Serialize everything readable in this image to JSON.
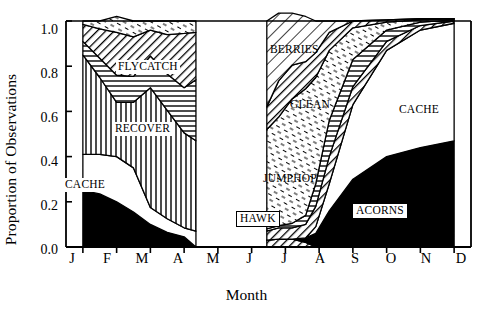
{
  "chart_data": {
    "type": "area",
    "title": "",
    "subtitle": "",
    "xlabel": "Month",
    "ylabel": "Proportion of Observations",
    "xlim": [
      0.5,
      12.5
    ],
    "ylim": [
      0.0,
      1.0
    ],
    "grid": false,
    "legend_position": "inline-annotations",
    "stacked": true,
    "normalized": true,
    "categories": [
      "J",
      "F",
      "M",
      "A",
      "M",
      "J",
      "J",
      "A",
      "S",
      "O",
      "N",
      "D"
    ],
    "xtick_labels": [
      "J",
      "F",
      "M",
      "A",
      "M",
      "J",
      "J",
      "A",
      "S",
      "O",
      "N",
      "D"
    ],
    "ytick_labels": [
      "0.0",
      "0.2",
      "0.4",
      "0.6",
      "0.8",
      "1.0"
    ],
    "ytick_values": [
      0.0,
      0.2,
      0.4,
      0.6,
      0.8,
      1.0
    ],
    "note": "Two disjoint data panels: winter-spring (Jan-late Apr) and summer-winter (mid Jun-Dec); no data plotted for May to mid June.",
    "panels": [
      {
        "name": "winter-spring",
        "x_start": 1.0,
        "x_end": 4.35,
        "series": [
          {
            "name": "ACORNS",
            "fill": "black",
            "x": [
              1.0,
              1.5,
              2.0,
              2.5,
              3.0,
              3.5,
              4.0,
              4.35
            ],
            "values": [
              0.25,
              0.235,
              0.2,
              0.155,
              0.1,
              0.065,
              0.045,
              0.0
            ]
          },
          {
            "name": "CACHE",
            "fill": "white",
            "x": [
              1.0,
              1.5,
              2.0,
              2.5,
              3.0,
              3.5,
              4.0,
              4.35
            ],
            "values": [
              0.16,
              0.175,
              0.2,
              0.195,
              0.075,
              0.06,
              0.04,
              0.07
            ]
          },
          {
            "name": "RECOVER",
            "fill": "vertical-lines",
            "x": [
              1.0,
              1.5,
              2.0,
              2.5,
              3.0,
              3.5,
              4.0,
              4.35
            ],
            "values": [
              0.44,
              0.34,
              0.24,
              0.29,
              0.53,
              0.48,
              0.42,
              0.4
            ]
          },
          {
            "name": "HORIZ-BAND",
            "fill": "horizontal-lines",
            "x": [
              1.0,
              1.5,
              2.0,
              2.5,
              3.0,
              3.5,
              4.0,
              4.35
            ],
            "values": [
              0.06,
              0.085,
              0.12,
              0.115,
              0.14,
              0.16,
              0.2,
              0.27
            ]
          },
          {
            "name": "FLYCATCH",
            "fill": "diagonal-hatch",
            "x": [
              1.0,
              1.5,
              2.0,
              2.5,
              3.0,
              3.5,
              4.0,
              4.35
            ],
            "values": [
              0.075,
              0.13,
              0.19,
              0.175,
              0.115,
              0.175,
              0.24,
              0.21
            ]
          },
          {
            "name": "DASH-TOP",
            "fill": "dash-texture",
            "x": [
              1.0,
              1.5,
              2.0,
              2.5,
              3.0,
              3.5,
              4.0,
              4.35
            ],
            "values": [
              0.015,
              0.035,
              0.07,
              0.07,
              0.04,
              0.06,
              0.055,
              0.05
            ]
          }
        ]
      },
      {
        "name": "summer-winter",
        "x_start": 6.45,
        "x_end": 12.0,
        "series": [
          {
            "name": "HAWK",
            "fill": "diagonal-hatch",
            "x": [
              6.45,
              6.8,
              7.2,
              7.6,
              7.9,
              8.3,
              9.0,
              10.0,
              11.0,
              12.0
            ],
            "values": [
              0.03,
              0.035,
              0.035,
              0.02,
              0.0,
              0.0,
              0.0,
              0.0,
              0.0,
              0.0
            ]
          },
          {
            "name": "ACORNS",
            "fill": "black",
            "x": [
              6.45,
              6.8,
              7.2,
              7.6,
              7.9,
              8.3,
              9.0,
              10.0,
              11.0,
              12.0
            ],
            "values": [
              0.0,
              0.0,
              0.0,
              0.02,
              0.06,
              0.16,
              0.3,
              0.4,
              0.44,
              0.47
            ]
          },
          {
            "name": "CACHE",
            "fill": "white",
            "x": [
              6.45,
              6.8,
              7.2,
              7.6,
              7.9,
              8.3,
              9.0,
              10.0,
              11.0,
              12.0
            ],
            "values": [
              0.0,
              0.0,
              0.0,
              0.0,
              0.03,
              0.12,
              0.33,
              0.47,
              0.52,
              0.52
            ]
          },
          {
            "name": "DIAG-BAND",
            "fill": "diagonal-hatch",
            "x": [
              6.45,
              6.8,
              7.2,
              7.6,
              7.9,
              8.3,
              9.0,
              10.0,
              11.0,
              12.0
            ],
            "values": [
              0.04,
              0.05,
              0.05,
              0.06,
              0.09,
              0.12,
              0.08,
              0.04,
              0.02,
              0.01
            ]
          },
          {
            "name": "RECOVER-BAND",
            "fill": "horizontal-lines",
            "x": [
              6.45,
              6.8,
              7.2,
              7.6,
              7.9,
              8.3,
              9.0,
              10.0,
              11.0,
              12.0
            ],
            "values": [
              0.01,
              0.01,
              0.02,
              0.04,
              0.1,
              0.16,
              0.12,
              0.05,
              0.015,
              0.005
            ]
          },
          {
            "name": "JUMPHOP",
            "fill": "dash-texture",
            "x": [
              6.45,
              6.8,
              7.2,
              7.6,
              7.9,
              8.3,
              9.0,
              10.0,
              11.0,
              12.0
            ],
            "values": [
              0.44,
              0.48,
              0.55,
              0.56,
              0.47,
              0.31,
              0.14,
              0.035,
              0.01,
              0.005
            ]
          },
          {
            "name": "GLEAN",
            "fill": "diagonal-hatch",
            "x": [
              6.45,
              6.8,
              7.2,
              7.6,
              7.9,
              8.3,
              9.0,
              10.0,
              11.0,
              12.0
            ],
            "values": [
              0.1,
              0.16,
              0.15,
              0.12,
              0.11,
              0.08,
              0.03,
              0.01,
              0.005,
              0.0
            ]
          },
          {
            "name": "BERRIES",
            "fill": "diagonal-hatch-wide",
            "x": [
              6.45,
              6.8,
              7.2,
              7.6,
              7.9,
              8.3,
              9.0,
              10.0,
              11.0,
              12.0
            ],
            "values": [
              0.38,
              0.3,
              0.23,
              0.2,
              0.14,
              0.05,
              0.0,
              0.0,
              0.0,
              0.0
            ]
          }
        ]
      }
    ],
    "annotations": [
      {
        "text": "FLYCATCH",
        "style": "white-bg"
      },
      {
        "text": "RECOVER",
        "style": "white-bg"
      },
      {
        "text": "CACHE",
        "style": "white-bg"
      },
      {
        "text": "BERRIES",
        "style": "transparent"
      },
      {
        "text": "GLEAN",
        "style": "transparent"
      },
      {
        "text": "CACHE",
        "style": "transparent"
      },
      {
        "text": "JUMPHOP",
        "style": "transparent"
      },
      {
        "text": "HAWK",
        "style": "boxed"
      },
      {
        "text": "ACORNS",
        "style": "boxed"
      }
    ]
  },
  "colors": {
    "background": "#ffffff",
    "ink": "#000000",
    "fill_black": "#000000",
    "fill_white": "#ffffff"
  }
}
